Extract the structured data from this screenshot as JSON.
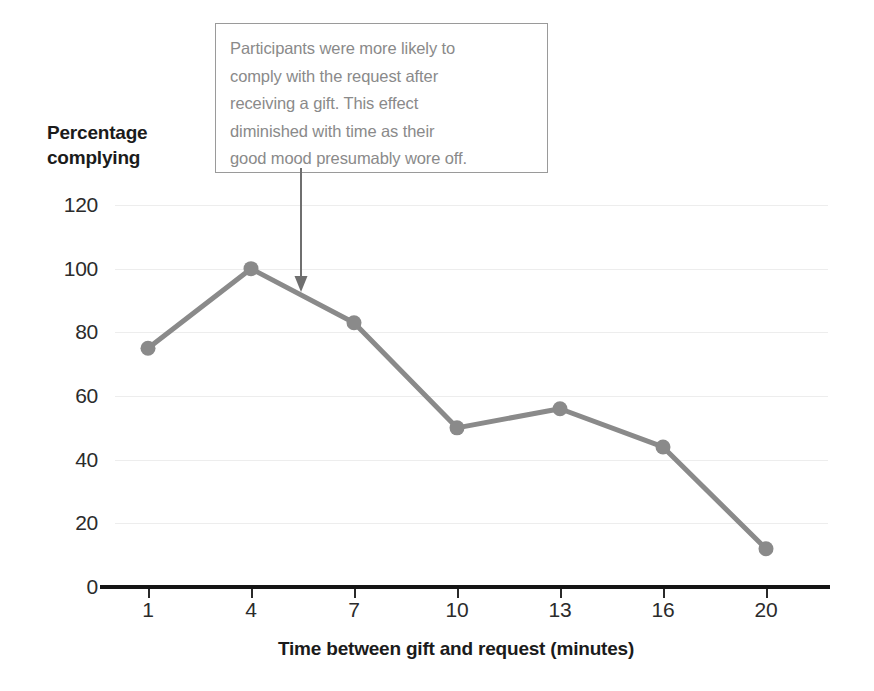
{
  "chart_data": {
    "type": "line",
    "title": "",
    "xlabel": "Time between gift and request (minutes)",
    "ylabel": "Percentage\ncomplying",
    "categories": [
      "1",
      "4",
      "7",
      "10",
      "13",
      "16",
      "20"
    ],
    "values": [
      75,
      100,
      83,
      50,
      56,
      44,
      12
    ],
    "series": [
      {
        "name": "Percentage complying",
        "values": [
          75,
          100,
          83,
          50,
          56,
          44,
          12
        ]
      }
    ],
    "ylim": [
      0,
      120
    ],
    "yticks": [
      "0",
      "20",
      "40",
      "60",
      "80",
      "100",
      "120"
    ],
    "ytick_values": [
      0,
      20,
      40,
      60,
      80,
      100,
      120
    ],
    "grid": true,
    "legend": "none",
    "series_color": "#8a8a8a",
    "marker_color": "#8a8a8a",
    "gridline_color": "#ededed",
    "axis_color": "#151515",
    "annotations": [
      {
        "text": "Participants were more likely to\ncomply with the request after\nreceiving a gift. This effect\ndiminished with time as their\ngood mood presumably wore off.",
        "border_color": "#9a9a9a",
        "text_color": "#8a8a8a",
        "arrow_color": "#6f6f6f",
        "points_to_x": "7"
      }
    ]
  }
}
